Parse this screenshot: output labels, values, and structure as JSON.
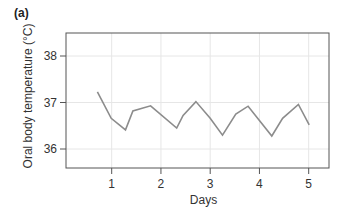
{
  "panel_label": "(a)",
  "chart_data": {
    "type": "line",
    "title": "",
    "xlabel": "Days",
    "ylabel": "Oral body temperature (°C)",
    "xlim": [
      0,
      5.4
    ],
    "ylim": [
      35.6,
      38.5
    ],
    "xticks": [
      1,
      2,
      3,
      4,
      5
    ],
    "yticks": [
      36,
      37,
      38
    ],
    "grid": true,
    "legend": null,
    "series": [
      {
        "name": "Oral body temperature",
        "color": "#8c8c8c",
        "x": [
          0.71,
          0.99,
          1.28,
          1.43,
          1.79,
          2.32,
          2.45,
          2.71,
          3.0,
          3.25,
          3.52,
          3.77,
          4.25,
          4.47,
          4.79,
          5.01
        ],
        "y": [
          37.23,
          36.66,
          36.41,
          36.82,
          36.93,
          36.45,
          36.72,
          37.02,
          36.66,
          36.3,
          36.75,
          36.92,
          36.28,
          36.66,
          36.96,
          36.52
        ]
      }
    ]
  },
  "colors": {
    "line": "#8c8c8c",
    "axis": "#555555",
    "grid": "#e6e6e6",
    "text": "#333333"
  }
}
